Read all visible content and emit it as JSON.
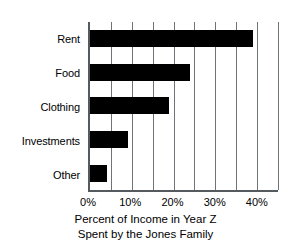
{
  "chart_data": {
    "type": "bar",
    "orientation": "horizontal",
    "title": "",
    "subtitle": "",
    "categories": [
      "Rent",
      "Food",
      "Clothing",
      "Investments",
      "Other"
    ],
    "values": [
      39,
      24,
      19,
      9,
      4
    ],
    "series": [
      {
        "name": "Percent of Income",
        "values": [
          39,
          24,
          19,
          9,
          4
        ]
      }
    ],
    "xlabel": "Percent of Income in Year Z Spent by the Jones Family",
    "ylabel": "",
    "xlim": [
      0,
      45
    ],
    "ylim": null,
    "xtick_values": [
      0,
      10,
      20,
      30,
      40
    ],
    "xtick_labels": [
      "0%",
      "10%",
      "20%",
      "30%",
      "40%"
    ],
    "gridline_values": [
      0,
      5,
      10,
      15,
      20,
      25,
      30,
      35,
      40,
      45
    ],
    "grid": true,
    "grid_axis": "x",
    "legend": false,
    "legend_position": "none",
    "bar_color": "#000000",
    "axis_color": "#555a5e",
    "grid_color": "#6e7377",
    "background_color": "#ffffff"
  },
  "caption": {
    "line1": "Percent of Income in Year Z",
    "line2": "Spent by the Jones Family"
  }
}
